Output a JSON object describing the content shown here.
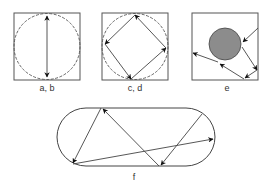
{
  "figure": {
    "panels": [
      {
        "id": "ab",
        "label": "a, b",
        "type": "square-with-inscribed-circle",
        "trajectory": "vertical bouncing diameter"
      },
      {
        "id": "cd",
        "label": "c, d",
        "type": "square-with-inscribed-circle",
        "trajectory": "inscribed diamond loop"
      },
      {
        "id": "e",
        "label": "e",
        "type": "square-with-circular-obstacle",
        "trajectory": "scattering off disk"
      },
      {
        "id": "f",
        "label": "f",
        "type": "stadium",
        "trajectory": "chaotic billiard path"
      }
    ],
    "colors": {
      "stroke": "#444444",
      "obstacle_fill": "#8c8c8c",
      "background": "#ffffff"
    }
  }
}
